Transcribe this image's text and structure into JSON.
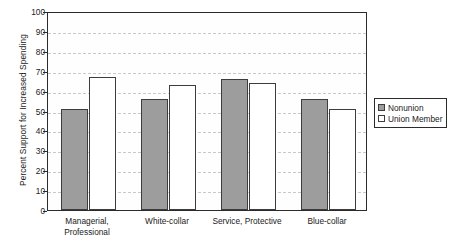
{
  "chart_data": {
    "type": "bar",
    "title": "",
    "subtitle": "",
    "xlabel": "",
    "ylabel": "Percent Support for Increased Spending",
    "categories": [
      "Managerial, Professional",
      "White-collar",
      "Service, Protective",
      "Blue-collar"
    ],
    "category_lines": [
      [
        "Managerial,",
        "Professional"
      ],
      [
        "White-collar"
      ],
      [
        "Service, Protective"
      ],
      [
        "Blue-collar"
      ]
    ],
    "series": [
      {
        "name": "Nonunion",
        "color": "#9d9d9d",
        "values": [
          51,
          56,
          66,
          56
        ]
      },
      {
        "name": "Union Member",
        "color": "#ffffff",
        "values": [
          67,
          63,
          64,
          51
        ]
      }
    ],
    "ylim": [
      0,
      100
    ],
    "ytick_step": 10,
    "yticks": [
      0,
      10,
      20,
      30,
      40,
      50,
      60,
      70,
      80,
      90,
      100
    ],
    "ytick_labels": [
      "0",
      "10",
      "20",
      "30",
      "40",
      "50",
      "60",
      "70",
      "80",
      "90",
      "100"
    ],
    "grid": true,
    "grid_style": "dashed",
    "grid_color": "#c9c9c9",
    "legend_position": "right-outside",
    "legend_entries": [
      "Nonunion",
      "Union Member"
    ],
    "bar_edge_color": "#3d3d3d",
    "frame_color": "#2b2b2b",
    "background_color": "#ffffff"
  }
}
